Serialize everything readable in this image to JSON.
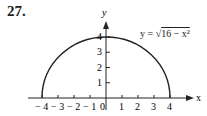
{
  "problem_number": "27.",
  "equation": {
    "lhs": "y = ",
    "radical": "√",
    "radicand": "16 − x²"
  },
  "chart_data": {
    "type": "line",
    "title": "",
    "function": "y = sqrt(16 - x^2)",
    "xlabel": "x",
    "ylabel": "y",
    "x_ticks": [
      "-4",
      "-3",
      "-2",
      "-1",
      "0",
      "1",
      "2",
      "3",
      "4"
    ],
    "y_ticks": [
      "1",
      "2",
      "3",
      "4"
    ],
    "xlim": [
      -4,
      4
    ],
    "ylim": [
      0,
      4
    ],
    "x": [
      -4,
      -3,
      -2,
      -1,
      0,
      1,
      2,
      3,
      4
    ],
    "y": [
      0,
      2.65,
      3.46,
      3.87,
      4,
      3.87,
      3.46,
      2.65,
      0
    ],
    "grid": false,
    "legend": "none",
    "annotation": "y = √(16 − x²)"
  }
}
